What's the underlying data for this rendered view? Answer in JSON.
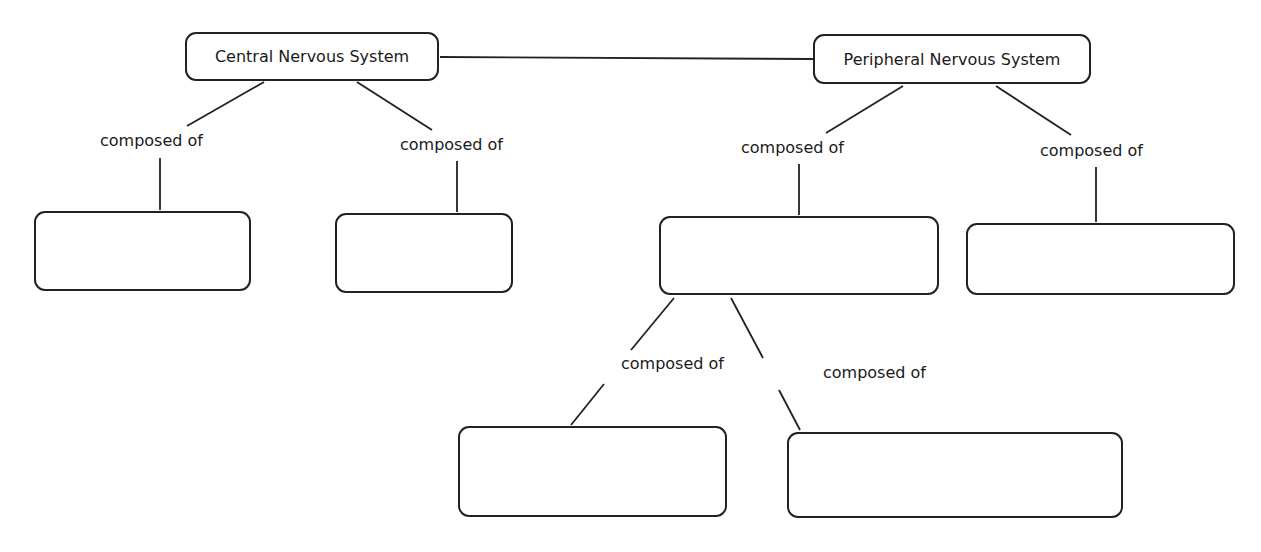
{
  "diagram": {
    "type": "concept-map",
    "nodes": [
      {
        "id": "cns",
        "label": "Central Nervous System",
        "x": 185,
        "y": 32,
        "w": 254,
        "h": 49
      },
      {
        "id": "pns",
        "label": "Peripheral Nervous System",
        "x": 813,
        "y": 34,
        "w": 278,
        "h": 50
      },
      {
        "id": "blank1",
        "label": "",
        "x": 34,
        "y": 211,
        "w": 217,
        "h": 80
      },
      {
        "id": "blank2",
        "label": "",
        "x": 335,
        "y": 213,
        "w": 178,
        "h": 80
      },
      {
        "id": "blank3",
        "label": "",
        "x": 659,
        "y": 216,
        "w": 280,
        "h": 79
      },
      {
        "id": "blank4",
        "label": "",
        "x": 966,
        "y": 223,
        "w": 269,
        "h": 72
      },
      {
        "id": "blank5",
        "label": "",
        "x": 458,
        "y": 426,
        "w": 269,
        "h": 91
      },
      {
        "id": "blank6",
        "label": "",
        "x": 787,
        "y": 432,
        "w": 336,
        "h": 86
      }
    ],
    "link_labels": [
      {
        "text": "composed of",
        "x": 100,
        "y": 131
      },
      {
        "text": "composed of",
        "x": 400,
        "y": 135
      },
      {
        "text": "composed of",
        "x": 741,
        "y": 138
      },
      {
        "text": "composed of",
        "x": 1040,
        "y": 141
      },
      {
        "text": "composed of",
        "x": 621,
        "y": 354
      },
      {
        "text": "composed of",
        "x": 823,
        "y": 363
      }
    ],
    "edges": [
      {
        "from": "cns",
        "to": "pns",
        "label": ""
      },
      {
        "from": "cns",
        "to": "blank1",
        "label": "composed of"
      },
      {
        "from": "cns",
        "to": "blank2",
        "label": "composed of"
      },
      {
        "from": "pns",
        "to": "blank3",
        "label": "composed of"
      },
      {
        "from": "pns",
        "to": "blank4",
        "label": "composed of"
      },
      {
        "from": "blank3",
        "to": "blank5",
        "label": "composed of"
      },
      {
        "from": "blank3",
        "to": "blank6",
        "label": "composed of"
      }
    ]
  }
}
